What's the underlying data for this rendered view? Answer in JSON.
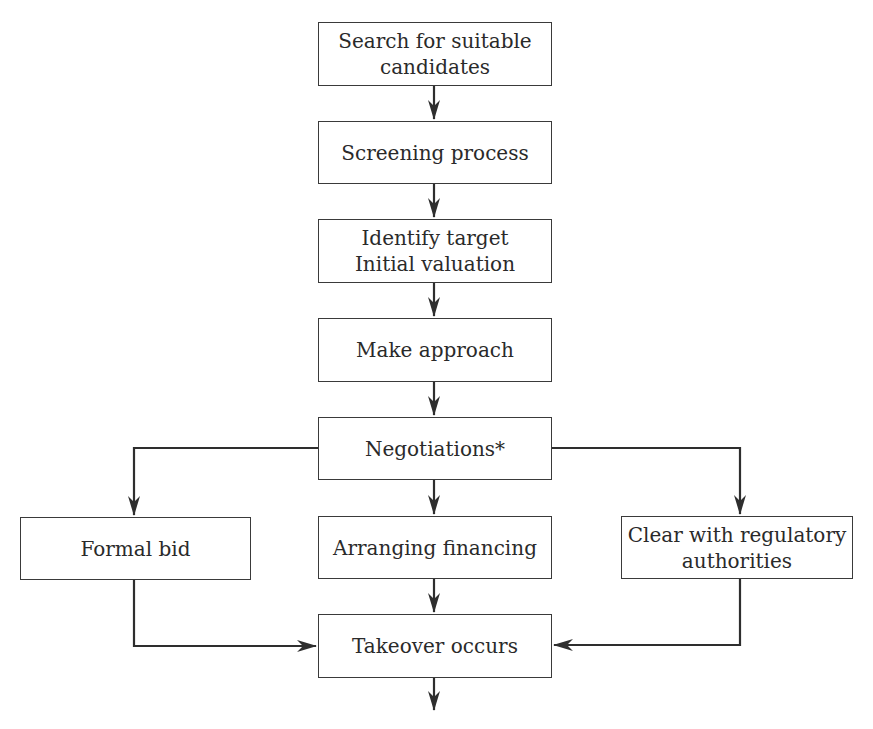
{
  "diagram": {
    "type": "flowchart",
    "colors": {
      "line": "#2e2e2e",
      "box_border": "#3a3a3a",
      "text": "#2a2a2a",
      "background": "#ffffff"
    },
    "nodes": [
      {
        "id": "search",
        "label": "Search for suitable\ncandidates"
      },
      {
        "id": "screening",
        "label": "Screening process"
      },
      {
        "id": "identify",
        "label": "Identify target\nInitial valuation"
      },
      {
        "id": "approach",
        "label": "Make approach"
      },
      {
        "id": "negotiations",
        "label": "Negotiations*"
      },
      {
        "id": "formal_bid",
        "label": "Formal bid"
      },
      {
        "id": "financing",
        "label": "Arranging financing"
      },
      {
        "id": "regulatory",
        "label": "Clear with regulatory\nauthorities"
      },
      {
        "id": "takeover",
        "label": "Takeover occurs"
      }
    ],
    "edges": [
      {
        "from": "search",
        "to": "screening"
      },
      {
        "from": "screening",
        "to": "identify"
      },
      {
        "from": "identify",
        "to": "approach"
      },
      {
        "from": "approach",
        "to": "negotiations"
      },
      {
        "from": "negotiations",
        "to": "formal_bid"
      },
      {
        "from": "negotiations",
        "to": "financing"
      },
      {
        "from": "negotiations",
        "to": "regulatory"
      },
      {
        "from": "formal_bid",
        "to": "takeover"
      },
      {
        "from": "financing",
        "to": "takeover"
      },
      {
        "from": "regulatory",
        "to": "takeover"
      },
      {
        "from": "takeover",
        "to": "(exit)"
      }
    ]
  }
}
